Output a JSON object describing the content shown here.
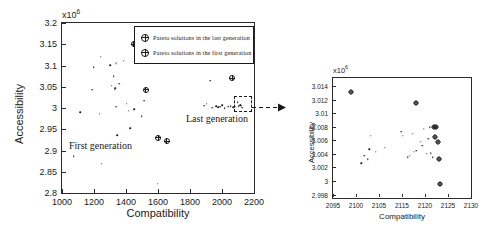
{
  "figure": {
    "background": "#ffffff",
    "foreground": "#1a1a1a"
  },
  "legend": {
    "position": "top-right-inside",
    "items": [
      {
        "marker": "crossed-circle-icon",
        "label": "Pareto solutions in the last generation"
      },
      {
        "marker": "crossed-circle-icon",
        "label": "Pareto solutions in the first generation"
      }
    ]
  },
  "annotations": {
    "first_generation": "First generation",
    "last_generation": "Last generation",
    "callout": "dashed-box-arrow-to-inset"
  },
  "chart_data": [
    {
      "id": "main",
      "type": "scatter",
      "title": "",
      "xlabel": "Compatibility",
      "ylabel": "Accessibility",
      "y_exponent_label": "x10⁶",
      "y_exponent": 6,
      "xlim": [
        1000,
        2200
      ],
      "ylim": [
        2.8,
        3.2
      ],
      "xticks": [
        1000,
        1200,
        1400,
        1600,
        1800,
        2000,
        2200
      ],
      "yticks": [
        2.8,
        2.85,
        2.9,
        2.95,
        3.0,
        3.05,
        3.1,
        3.15,
        3.2
      ],
      "xtick_labels": [
        "1000",
        "1200",
        "1400",
        "1600",
        "1800",
        "2000",
        "2200"
      ],
      "ytick_labels": [
        "2.8",
        "2.85",
        "2.9",
        "2.95",
        "3",
        "3.05",
        "3.1",
        "3.15",
        "3.2"
      ],
      "grid": false,
      "legend_position": "upper right",
      "series": [
        {
          "name": "Pareto solutions in the first generation",
          "marker": "crossed-circle",
          "points": [
            [
              1448,
              3.15
            ],
            [
              1524,
              3.043
            ],
            [
              1601,
              2.93
            ],
            [
              1655,
              2.922
            ],
            [
              2065,
              3.07
            ]
          ]
        },
        {
          "name": "Population solutions",
          "marker": "dot",
          "points": [
            [
              1073,
              2.886
            ],
            [
              1115,
              2.99
            ],
            [
              1190,
              3.043
            ],
            [
              1199,
              3.096
            ],
            [
              1236,
              2.987
            ],
            [
              1243,
              3.121
            ],
            [
              1247,
              2.869
            ],
            [
              1300,
              3.101
            ],
            [
              1310,
              3.052
            ],
            [
              1322,
              3.075
            ],
            [
              1330,
              3.043
            ],
            [
              1333,
              3.046
            ],
            [
              1335,
              3.104
            ],
            [
              1338,
              3.003
            ],
            [
              1341,
              3.107
            ],
            [
              1346,
              2.936
            ],
            [
              1358,
              3.057
            ],
            [
              1386,
              3.111
            ],
            [
              1405,
              3.01
            ],
            [
              1418,
              2.994
            ],
            [
              1425,
              2.952
            ],
            [
              1452,
              2.997
            ],
            [
              1498,
              2.981
            ],
            [
              1512,
              3.017
            ],
            [
              1597,
              2.822
            ],
            [
              1888,
              3.005
            ],
            [
              1905,
              3.01
            ],
            [
              1928,
              3.064
            ],
            [
              1938,
              3.001
            ],
            [
              1962,
              3.004
            ],
            [
              1975,
              3.002
            ],
            [
              1988,
              3.003
            ],
            [
              2002,
              3.006
            ],
            [
              2018,
              3.0
            ],
            [
              2040,
              3.003
            ],
            [
              2055,
              3.004
            ],
            [
              2070,
              3.002
            ],
            [
              2085,
              3.003
            ],
            [
              2098,
              3.013
            ],
            [
              2105,
              3.004
            ],
            [
              2112,
              3.006
            ],
            [
              2118,
              3.007
            ],
            [
              2122,
              3.005
            ],
            [
              2126,
              3.001
            ]
          ]
        }
      ]
    },
    {
      "id": "inset",
      "type": "scatter",
      "title": "",
      "xlabel": "Compatibility",
      "ylabel": "Accessibility",
      "y_exponent_label": "x10⁶",
      "y_exponent": 6,
      "xlim": [
        2092,
        2130
      ],
      "ylim": [
        2.9975,
        3.0152
      ],
      "xticks": [
        2095,
        2100,
        2105,
        2110,
        2115,
        2120,
        2125,
        2130
      ],
      "xtick_labels": [
        "2095",
        "2100",
        "2105",
        "2115",
        "2120",
        "2125",
        "2130"
      ],
      "yticks": [
        2.998,
        3.0,
        3.002,
        3.004,
        3.006,
        3.008,
        3.01,
        3.012,
        3.014
      ],
      "ytick_labels": [
        "2.998",
        "3",
        "3.002",
        "3.004",
        "3.006",
        "3.008",
        "3.01",
        "3.012",
        "3.014"
      ],
      "grid": false,
      "series": [
        {
          "name": "Pareto solutions in the last generation",
          "marker": "crossed-circle",
          "points": [
            [
              2096.9,
              3.0132
            ],
            [
              2114.8,
              3.0115
            ],
            [
              2119.9,
              3.0079
            ],
            [
              2120.4,
              3.0079
            ],
            [
              2120.2,
              3.0065
            ],
            [
              2121.0,
              3.0057
            ],
            [
              2121.3,
              3.0033
            ],
            [
              2121.4,
              2.9995
            ]
          ]
        },
        {
          "name": "Other solutions",
          "marker": "dot",
          "points": [
            [
              2102.4,
              3.0067
            ],
            [
              2102.0,
              3.0047
            ],
            [
              2101.6,
              3.0032
            ],
            [
              2100.6,
              3.0037
            ],
            [
              2099.8,
              3.0026
            ],
            [
              2106.2,
              3.0049
            ],
            [
              2103.8,
              3.0043
            ],
            [
              2110.8,
              3.0073
            ],
            [
              2111.2,
              3.0067
            ],
            [
              2114.0,
              3.007
            ],
            [
              2114.2,
              3.0043
            ],
            [
              2114.9,
              3.0045
            ],
            [
              2112.6,
              3.0035
            ],
            [
              2113.2,
              3.0037
            ],
            [
              2116.6,
              3.0052
            ],
            [
              2117.0,
              3.0077
            ],
            [
              2118.6,
              3.0079
            ],
            [
              2118.2,
              3.0062
            ],
            [
              2117.9,
              3.004
            ],
            [
              2119.0,
              3.0041
            ],
            [
              2119.4,
              3.0035
            ],
            [
              2116.2,
              3.0058
            ]
          ]
        }
      ]
    }
  ]
}
